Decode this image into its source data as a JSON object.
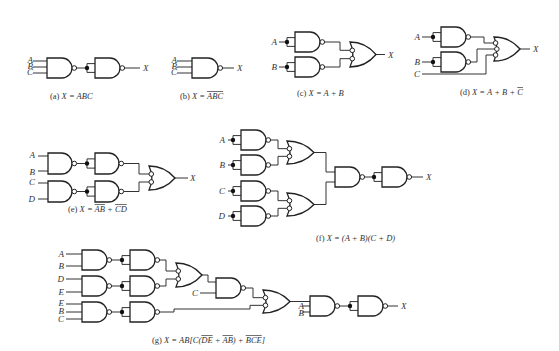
{
  "figure": {
    "panels": [
      {
        "id": "a",
        "caption_prefix": "(a)",
        "caption": "X = ABC",
        "inputs": [
          "A",
          "B",
          "C"
        ],
        "output": "X"
      },
      {
        "id": "b",
        "caption_prefix": "(b)",
        "caption": "X = ABC",
        "caption_overline": "ABC",
        "inputs": [
          "A",
          "B",
          "C"
        ],
        "output": "X"
      },
      {
        "id": "c",
        "caption_prefix": "(c)",
        "caption": "X = A + B",
        "inputs": [
          "A",
          "B"
        ],
        "output": "X"
      },
      {
        "id": "d",
        "caption_prefix": "(d)",
        "caption": "X = A + B + C",
        "caption_overline": "C",
        "inputs": [
          "A",
          "B",
          "C"
        ],
        "output": "X"
      },
      {
        "id": "e",
        "caption_prefix": "(e)",
        "caption": "X = AB + CD",
        "caption_overline": "AB, CD",
        "inputs": [
          "A",
          "B",
          "C",
          "D"
        ],
        "output": "X"
      },
      {
        "id": "f",
        "caption_prefix": "(f)",
        "caption": "X = (A + B)(C + D)",
        "inputs": [
          "A",
          "B",
          "C",
          "D"
        ],
        "output": "X"
      },
      {
        "id": "g",
        "caption_prefix": "(g)",
        "caption": "X = AB[C(DE + AB) + BCE]",
        "caption_overline": "DE, AB, BCE",
        "inputs": [
          "A",
          "B",
          "D",
          "E",
          "E",
          "B",
          "C",
          "C",
          "A",
          "B"
        ],
        "output": "X"
      }
    ]
  },
  "labels": {
    "A": "A",
    "B": "B",
    "C": "C",
    "D": "D",
    "E": "E",
    "X": "X"
  },
  "captions": {
    "a": {
      "prefix": "(a)",
      "lhs": "X = ",
      "body": "ABC"
    },
    "b": {
      "prefix": "(b)",
      "lhs": "X = ",
      "over": "ABC"
    },
    "c": {
      "prefix": "(c)",
      "lhs": "X = ",
      "body": "A + B"
    },
    "d": {
      "prefix": "(d)",
      "lhs": "X = ",
      "body": "A + B + ",
      "over": "C"
    },
    "e": {
      "prefix": "(e)",
      "lhs": "X = ",
      "over1": "AB",
      "mid": " + ",
      "over2": "CD"
    },
    "f": {
      "prefix": "(f)",
      "lhs": "X = ",
      "body": "(A + B)(C + D)"
    },
    "g": {
      "prefix": "(g)",
      "lhs": "X = ",
      "p1": "AB[C(",
      "over1": "DE",
      "p2": " + ",
      "over2": "AB",
      "p3": ") + ",
      "over3": "BCE",
      "p4": "]"
    }
  }
}
